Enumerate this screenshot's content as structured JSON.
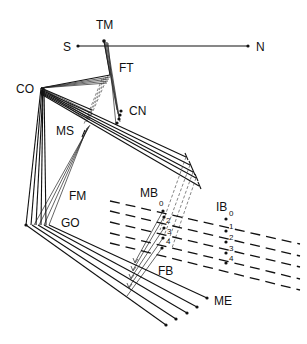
{
  "figure": {
    "type": "biomechanics line diagram",
    "axis": {
      "left_label": "S",
      "right_label": "N"
    },
    "labels": {
      "tm": "TM",
      "ft": "FT",
      "co": "CO",
      "cn": "CN",
      "ms": "MS",
      "fm": "FM",
      "go": "GO",
      "mb": "MB",
      "ib": "IB",
      "fb": "FB",
      "me": "ME"
    },
    "mb_indices": [
      "0",
      "1",
      "2",
      "3",
      "4"
    ],
    "ib_indices": [
      "0",
      "1",
      "2",
      "3",
      "4"
    ],
    "colors": {
      "ink": "#111111",
      "background": "#ffffff"
    }
  }
}
